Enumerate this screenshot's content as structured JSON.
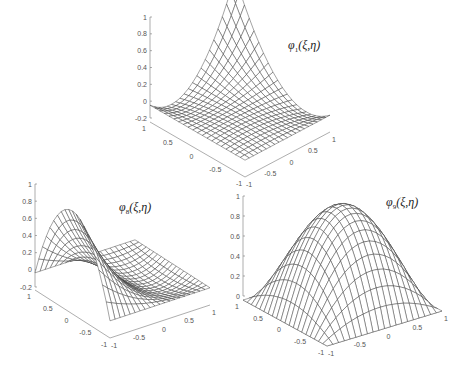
{
  "figure": {
    "background": "#ffffff",
    "line_color": "#333333"
  },
  "chart_data": [
    {
      "type": "surface",
      "id": "phi1",
      "title": "φ1(ξ,η)",
      "title_symbol": "φ",
      "title_subscript": "1",
      "title_args": "(ξ,η)",
      "description": "Corner shape function: peak of 1 at corner (ξ,η)=(1,1) (back), dipping to about -0.125 along edges, 0 elsewhere",
      "x_range": [
        -1,
        1
      ],
      "y_range": [
        -1,
        1
      ],
      "z_range": [
        -0.2,
        1
      ],
      "x_ticks": [
        "-1",
        "-0.5",
        "0",
        "0.5",
        "1"
      ],
      "y_ticks": [
        "1",
        "0.5",
        "0",
        "-0.5",
        "-1"
      ],
      "z_ticks": [
        "-0.2",
        "0",
        "0.2",
        "0.4",
        "0.6",
        "0.8",
        "1"
      ],
      "grid_lines": 21,
      "peak": {
        "xi": 1,
        "eta": 1,
        "value": 1
      },
      "geometry": {
        "zaxis_x": 150,
        "z_top_y": 17,
        "z_bottom_y": 118,
        "z_min": -0.2,
        "z_max": 1,
        "front": [
          245,
          177
        ],
        "left": [
          150,
          122
        ],
        "right": [
          330,
          132
        ],
        "title_pos": [
          288,
          38
        ]
      }
    },
    {
      "type": "surface",
      "id": "phi8",
      "title": "φ8(ξ,η)",
      "title_symbol": "φ",
      "title_subscript": "8",
      "title_args": "(ξ,η)",
      "description": "Mid-side shape function: peak of 1 at midpoint of the ξ=-1 edge (left), decaying to 0 / slightly negative across the element",
      "x_range": [
        -1,
        1
      ],
      "y_range": [
        -1,
        1
      ],
      "z_range": [
        -0.2,
        1
      ],
      "x_ticks": [
        "-1",
        "-0.5",
        "0",
        "0.5",
        "1"
      ],
      "y_ticks": [
        "1",
        "0.5",
        "0",
        "-0.5",
        "-1"
      ],
      "z_ticks": [
        "-0.2",
        "0",
        "0.2",
        "0.4",
        "0.6",
        "0.8",
        "1"
      ],
      "grid_lines": 21,
      "peak": {
        "xi": -1,
        "eta": 0,
        "value": 1
      },
      "geometry": {
        "zaxis_x": 35,
        "z_top_y": 184,
        "z_bottom_y": 287,
        "z_min": -0.2,
        "z_max": 1,
        "front": [
          110,
          338
        ],
        "left": [
          35,
          290
        ],
        "right": [
          210,
          305
        ],
        "title_pos": [
          119,
          200
        ]
      }
    },
    {
      "type": "surface",
      "id": "phi9",
      "title": "φ9(ξ,η)",
      "title_symbol": "φ",
      "title_subscript": "9",
      "title_args": "(ξ,η)",
      "description": "Center bubble shape function: (1-ξ²)(1-η²), peak 1 at center, 0 on all edges",
      "x_range": [
        -1,
        1
      ],
      "y_range": [
        -1,
        1
      ],
      "z_range": [
        0,
        1
      ],
      "x_ticks": [
        "-1",
        "-0.5",
        "0",
        "0.5",
        "1"
      ],
      "y_ticks": [
        "1",
        "0.5",
        "0",
        "-0.5",
        "-1"
      ],
      "z_ticks": [
        "0",
        "0.2",
        "0.4",
        "0.6",
        "0.8",
        "1"
      ],
      "grid_lines": 21,
      "peak": {
        "xi": 0,
        "eta": 0,
        "value": 1
      },
      "geometry": {
        "zaxis_x": 243,
        "z_top_y": 196,
        "z_bottom_y": 296,
        "z_min": 0,
        "z_max": 1,
        "front": [
          327,
          346
        ],
        "left": [
          243,
          300
        ],
        "right": [
          442,
          311
        ],
        "title_pos": [
          386,
          195
        ]
      }
    }
  ]
}
